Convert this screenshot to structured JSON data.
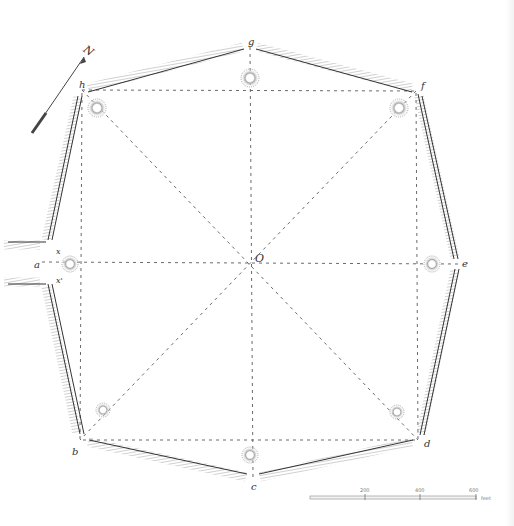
{
  "figure": {
    "type": "archaeological-earthwork-plan"
  },
  "north_arrow": {
    "label": "N"
  },
  "center": {
    "label": "O"
  },
  "vertices": [
    {
      "id": "g",
      "label": "g",
      "x": 250,
      "y": 47
    },
    {
      "id": "f",
      "label": "f",
      "x": 416,
      "y": 91
    },
    {
      "id": "e",
      "label": "e",
      "x": 458,
      "y": 264
    },
    {
      "id": "d",
      "label": "d",
      "x": 418,
      "y": 440
    },
    {
      "id": "c",
      "label": "c",
      "x": 253,
      "y": 478
    },
    {
      "id": "b",
      "label": "b",
      "x": 80,
      "y": 440
    },
    {
      "id": "a",
      "label": "a",
      "x": 42,
      "y": 262
    },
    {
      "id": "h",
      "label": "h",
      "x": 82,
      "y": 90
    }
  ],
  "gate_labels": {
    "upper": "x",
    "lower": "x'"
  },
  "mounds": [
    {
      "x": 250,
      "y": 78
    },
    {
      "x": 97,
      "y": 108
    },
    {
      "x": 399,
      "y": 108
    },
    {
      "x": 70,
      "y": 264
    },
    {
      "x": 432,
      "y": 264
    },
    {
      "x": 103,
      "y": 410
    },
    {
      "x": 397,
      "y": 412
    },
    {
      "x": 250,
      "y": 455
    }
  ],
  "scale_bar": {
    "ticks": [
      "200",
      "400",
      "600"
    ],
    "unit": "feet"
  },
  "colors": {
    "ink": "#333333",
    "hatch": "#9a9a9a",
    "dashed": "#6a6a6a",
    "background": "#ffffff"
  }
}
